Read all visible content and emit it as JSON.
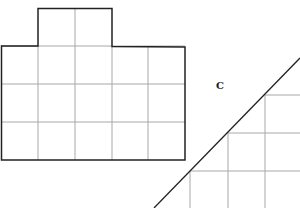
{
  "figure": {
    "label_c": "C",
    "grid_color": "#a8a8a8",
    "outline_color": "#222222",
    "shape_a": {
      "description": "Rectangle 5 wide by 3 tall with a 2-cell tab on top",
      "cols": 5,
      "rows": 3,
      "tab_cells": 2
    },
    "shape_c": {
      "description": "Right triangle with grid cells, diagonal hypotenuse"
    }
  }
}
